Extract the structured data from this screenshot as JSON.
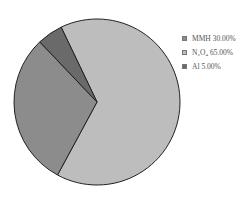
{
  "chart_data": {
    "type": "pie",
    "title": "",
    "categories": [
      "MMH",
      "N2O4",
      "Al"
    ],
    "values": [
      30.0,
      65.0,
      5.0
    ],
    "colors": [
      "#8c8c8c",
      "#bdbdbd",
      "#6a6a6a"
    ],
    "legend_position": "right"
  },
  "legend": [
    {
      "label": "MMH 30.00%",
      "color": "#8c8c8c"
    },
    {
      "label": "N₂O₄ 65.00%",
      "color": "#bdbdbd"
    },
    {
      "label": "Al 5.00%",
      "color": "#6a6a6a"
    }
  ]
}
